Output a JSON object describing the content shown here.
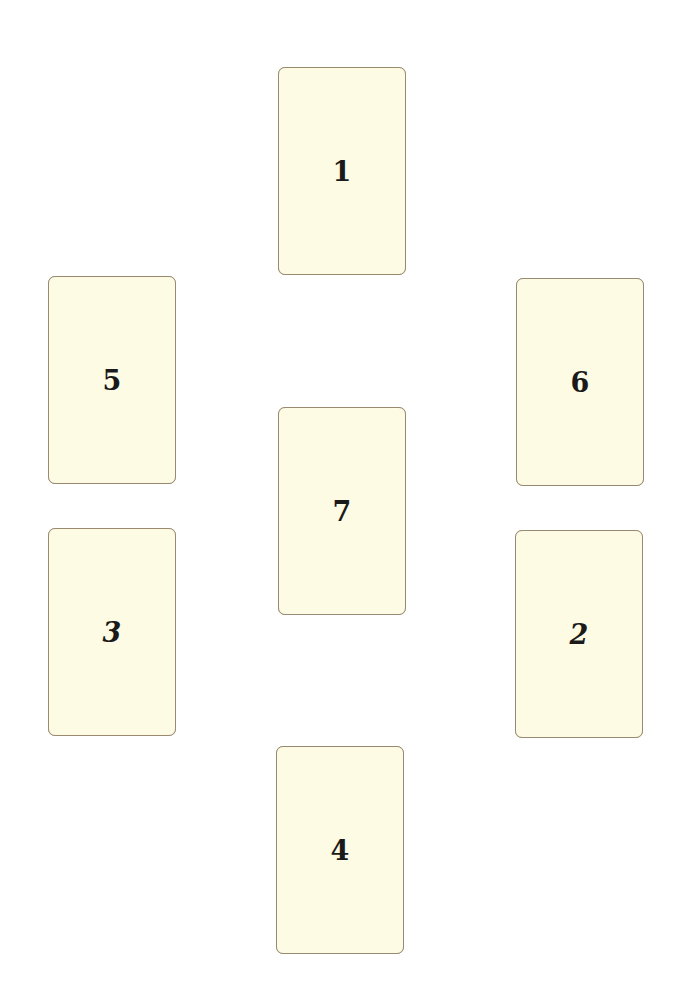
{
  "colors": {
    "background": "#ffffff",
    "card_fill": "#fdfbe4",
    "card_border": "#988a70",
    "numeral": "#1a1a1a"
  },
  "cards": [
    {
      "position": "1",
      "label": "1",
      "x": 278,
      "y": 67,
      "style": "upright"
    },
    {
      "position": "2",
      "label": "2",
      "x": 515,
      "y": 530,
      "style": "italic"
    },
    {
      "position": "3",
      "label": "3",
      "x": 48,
      "y": 528,
      "style": "italic"
    },
    {
      "position": "4",
      "label": "4",
      "x": 276,
      "y": 746,
      "style": "upright"
    },
    {
      "position": "5",
      "label": "5",
      "x": 48,
      "y": 276,
      "style": "upright"
    },
    {
      "position": "6",
      "label": "6",
      "x": 516,
      "y": 278,
      "style": "upright"
    },
    {
      "position": "7",
      "label": "7",
      "x": 278,
      "y": 407,
      "style": "upright"
    }
  ]
}
